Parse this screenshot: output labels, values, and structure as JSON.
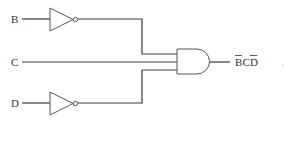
{
  "diagram": {
    "type": "logic-circuit",
    "inputs": [
      {
        "label": "B",
        "inverted": true
      },
      {
        "label": "C",
        "inverted": false
      },
      {
        "label": "D",
        "inverted": true
      }
    ],
    "gates": [
      {
        "type": "NOT",
        "input": "B"
      },
      {
        "type": "NOT",
        "input": "D"
      },
      {
        "type": "AND",
        "inputs": [
          "B'",
          "C",
          "D'"
        ]
      }
    ],
    "output": {
      "label_parts": [
        {
          "text": "B",
          "overline": true
        },
        {
          "text": "C",
          "overline": false
        },
        {
          "text": "D",
          "overline": true
        }
      ],
      "expression": "B̄CD̄"
    }
  },
  "labels": {
    "input_b": "B",
    "input_c": "C",
    "input_d": "D",
    "out_b": "B",
    "out_c": "C",
    "out_d": "D"
  },
  "colors": {
    "line": "#3a3a3a",
    "text": "#333333",
    "background": "#ffffff"
  }
}
